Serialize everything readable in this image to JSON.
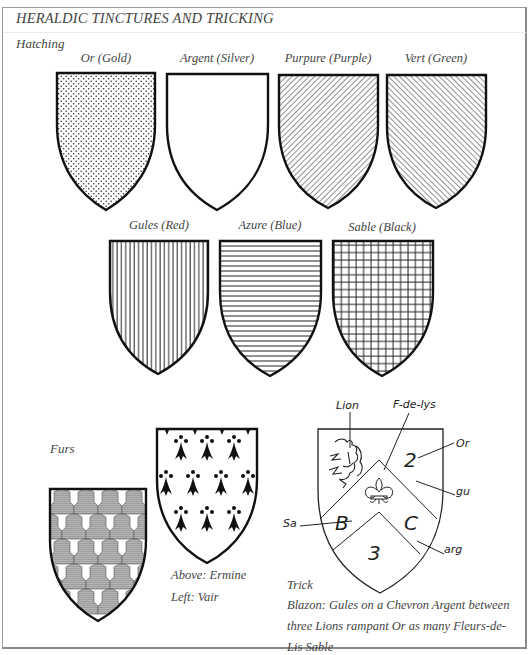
{
  "title": "HERALDIC TINCTURES AND TRICKING",
  "sections": {
    "hatching": "Hatching",
    "furs": "Furs"
  },
  "tinctures": [
    {
      "name": "Or (Gold)",
      "pattern": "dots"
    },
    {
      "name": "Argent (Silver)",
      "pattern": "plain"
    },
    {
      "name": "Purpure (Purple)",
      "pattern": "diagonal-sinister"
    },
    {
      "name": "Vert (Green)",
      "pattern": "diagonal-dexter"
    },
    {
      "name": "Gules (Red)",
      "pattern": "vertical-lines"
    },
    {
      "name": "Azure (Blue)",
      "pattern": "horizontal-lines"
    },
    {
      "name": "Sable (Black)",
      "pattern": "grid"
    }
  ],
  "furs": {
    "caption_above": "Above: Ermine",
    "caption_left": "Left: Vair"
  },
  "trick": {
    "label": "Trick",
    "blazon": [
      "Blazon: Gules on a Chevron Argent between",
      "three Lions rampant Or as many Fleurs-de-",
      "Lis Sable"
    ],
    "annotations": {
      "lion": "Lion",
      "fleur": "F-de-lys",
      "or": "Or",
      "gu": "gu",
      "arg": "arg",
      "sa": "Sa",
      "num2": "2",
      "numB": "B",
      "numC": "C",
      "num3": "3"
    }
  }
}
